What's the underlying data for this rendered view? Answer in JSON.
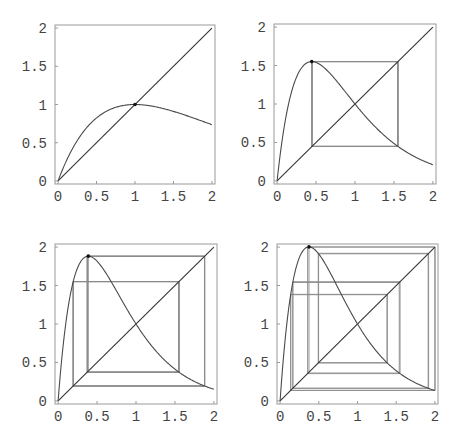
{
  "figure": {
    "layout": "2x2 grid"
  },
  "chart_data": [
    {
      "type": "line",
      "panel": "top-left",
      "title": "",
      "xlabel": "",
      "ylabel": "",
      "xlim": [
        0,
        2
      ],
      "ylim": [
        0,
        2
      ],
      "xticks": [
        "0",
        "0.5",
        "1",
        "1.5",
        "2"
      ],
      "yticks": [
        "0",
        "0.5",
        "1",
        "1.5",
        "2"
      ],
      "grid": false,
      "legend": null,
      "series": [
        {
          "name": "f(x) = x*exp(r(1-x))",
          "r": 1.0,
          "max_point": {
            "x": 1.0,
            "y": 1.0
          },
          "value_at_2": 0.74
        },
        {
          "name": "y = x",
          "points": [
            [
              0,
              0
            ],
            [
              2,
              2
            ]
          ]
        }
      ],
      "cobweb": {
        "cycle_period": 1,
        "points": [
          [
            1.0,
            1.0
          ]
        ]
      },
      "marked_point": {
        "x": 1.0,
        "y": 1.0
      }
    },
    {
      "type": "line",
      "panel": "top-right",
      "title": "",
      "xlabel": "",
      "ylabel": "",
      "xlim": [
        0,
        2
      ],
      "ylim": [
        0,
        2
      ],
      "xticks": [
        "0",
        "0.5",
        "1",
        "1.5",
        "2"
      ],
      "yticks": [
        "0",
        "0.5",
        "1",
        "1.5",
        "2"
      ],
      "grid": false,
      "legend": null,
      "series": [
        {
          "name": "f(x) = x*exp(r(1-x))",
          "r": 2.25,
          "max_point": {
            "x": 0.44,
            "y": 1.55
          },
          "value_at_2": 0.21
        },
        {
          "name": "y = x",
          "points": [
            [
              0,
              0
            ],
            [
              2,
              2
            ]
          ]
        }
      ],
      "cobweb": {
        "cycle_period": 2,
        "points": [
          [
            0.44,
            1.55
          ],
          [
            1.55,
            0.45
          ]
        ]
      },
      "marked_point": {
        "x": 0.44,
        "y": 1.55
      }
    },
    {
      "type": "line",
      "panel": "bottom-left",
      "title": "",
      "xlabel": "",
      "ylabel": "",
      "xlim": [
        0,
        2
      ],
      "ylim": [
        0,
        2
      ],
      "xticks": [
        "0",
        "0.5",
        "1",
        "1.5",
        "2"
      ],
      "yticks": [
        "0",
        "0.5",
        "1",
        "1.5",
        "2"
      ],
      "grid": false,
      "legend": null,
      "series": [
        {
          "name": "f(x) = x*exp(r(1-x))",
          "r": 2.58,
          "max_point": {
            "x": 0.39,
            "y": 1.88
          },
          "value_at_2": 0.15
        },
        {
          "name": "y = x",
          "points": [
            [
              0,
              0
            ],
            [
              2,
              2
            ]
          ]
        }
      ],
      "cobweb": {
        "cycle_period": 4,
        "points": [
          [
            0.39,
            1.88
          ],
          [
            1.88,
            0.2
          ],
          [
            0.2,
            1.52
          ],
          [
            1.52,
            0.39
          ]
        ]
      },
      "marked_point": {
        "x": 0.39,
        "y": 1.88
      }
    },
    {
      "type": "line",
      "panel": "bottom-right",
      "title": "",
      "xlabel": "",
      "ylabel": "",
      "xlim": [
        0,
        2
      ],
      "ylim": [
        0,
        2
      ],
      "xticks": [
        "0",
        "0.5",
        "1",
        "1.5",
        "2"
      ],
      "yticks": [
        "0",
        "0.5",
        "1",
        "1.5",
        "2"
      ],
      "grid": false,
      "legend": null,
      "series": [
        {
          "name": "f(x) = x*exp(r(1-x))",
          "r": 2.68,
          "max_point": {
            "x": 0.37,
            "y": 2.0
          },
          "value_at_2": 0.14
        },
        {
          "name": "y = x",
          "points": [
            [
              0,
              0
            ],
            [
              2,
              2
            ]
          ]
        }
      ],
      "cobweb": {
        "cycle_period": 8,
        "iterations": 16
      },
      "marked_point": {
        "x": 0.37,
        "y": 2.0
      }
    }
  ],
  "panels": [
    {
      "id": "top-left",
      "frame": {
        "left": 55,
        "top": 25,
        "right": 215,
        "bottom": 184
      }
    },
    {
      "id": "top-right",
      "frame": {
        "left": 274,
        "top": 24,
        "right": 436,
        "bottom": 184
      }
    },
    {
      "id": "bottom-left",
      "frame": {
        "left": 55,
        "top": 244,
        "right": 217,
        "bottom": 404
      }
    },
    {
      "id": "bottom-right",
      "frame": {
        "left": 277,
        "top": 244,
        "right": 438,
        "bottom": 404
      }
    }
  ],
  "colors": {
    "background": "#ffffff",
    "frame": "#9a9a9a",
    "curve": "#4a4a4a",
    "diagonal": "#333333",
    "cobweb": "#8a8a8a",
    "labels": "#444444",
    "peak_marker": "#111111"
  }
}
